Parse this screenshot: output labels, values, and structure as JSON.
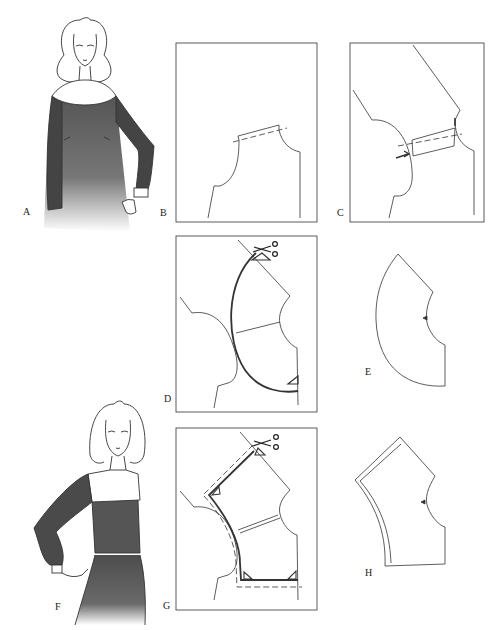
{
  "figure": {
    "labels": {
      "A": "A",
      "B": "B",
      "C": "C",
      "D": "D",
      "E": "E",
      "F": "F",
      "G": "G",
      "H": "H"
    },
    "icons": {
      "scissors": "scissors-icon",
      "arrow": "arrow-icon",
      "grain_mark": "triangle-mark-icon"
    },
    "colors": {
      "line": "#333333",
      "garment_dark": "#4a4a4a",
      "background": "#ffffff"
    }
  }
}
